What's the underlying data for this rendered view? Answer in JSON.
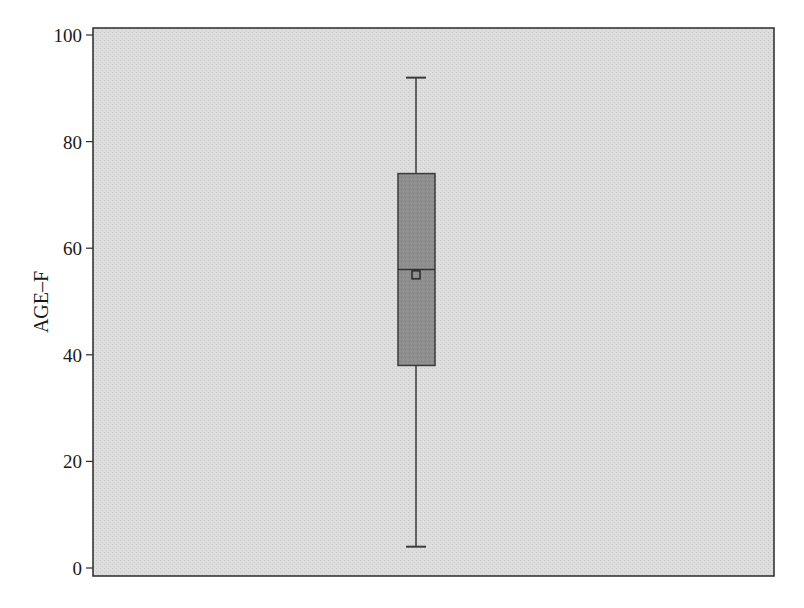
{
  "chart_data": {
    "type": "box",
    "title": "",
    "xlabel": "",
    "ylabel": "AGE–F",
    "ylim": [
      0,
      100
    ],
    "yticks": [
      0,
      20,
      40,
      60,
      80,
      100
    ],
    "ytick_labels": [
      "0",
      "20",
      "40",
      "60",
      "80",
      "100"
    ],
    "grid": false,
    "legend": null,
    "series": [
      {
        "name": "AGE–F",
        "min": 4,
        "q1": 38,
        "median": 56,
        "mean": 55,
        "q3": 74,
        "max": 92
      }
    ],
    "colors": {
      "plot_background": "#d9d9d9",
      "box_fill": "#8c8c8c",
      "box_stroke": "#3a3a3a",
      "whisker": "#3a3a3a",
      "frame": "#2a2a2a"
    }
  },
  "axis": {
    "y_label": "AGE–F",
    "ticks": [
      "0",
      "20",
      "40",
      "60",
      "80",
      "100"
    ]
  }
}
